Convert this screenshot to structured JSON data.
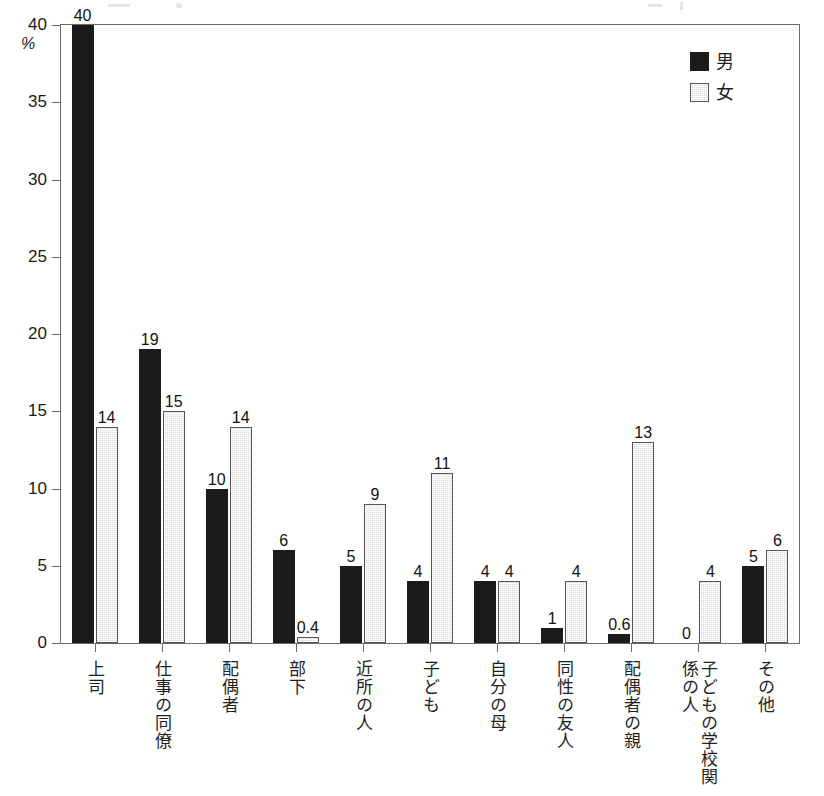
{
  "chart_data": {
    "type": "bar",
    "title": "",
    "xlabel": "",
    "ylabel": "%",
    "ylim": [
      0,
      40
    ],
    "yticks": [
      0,
      5,
      10,
      15,
      20,
      25,
      30,
      35,
      40
    ],
    "ytick_labels": [
      "0",
      "5",
      "10",
      "15",
      "20",
      "25",
      "30",
      "35",
      "40"
    ],
    "grid": false,
    "legend_position": "top-right",
    "categories": [
      "上司",
      "仕事の同僚",
      "配偶者",
      "部下",
      "近所の人",
      "子ども",
      "自分の母",
      "同性の友人",
      "配偶者の親",
      "子どもの学校関係の人",
      "その他"
    ],
    "series": [
      {
        "name": "男",
        "color": "#1b1b1b",
        "values": [
          40,
          19,
          10,
          6,
          5,
          4,
          4,
          1,
          0.6,
          0,
          5
        ],
        "value_labels": [
          "40",
          "19",
          "10",
          "6",
          "5",
          "4",
          "4",
          "1",
          "0.6",
          "0",
          "5"
        ]
      },
      {
        "name": "女",
        "color": "#dcdcdc",
        "values": [
          14,
          15,
          14,
          0.4,
          9,
          11,
          4,
          4,
          13,
          4,
          6
        ],
        "value_labels": [
          "14",
          "15",
          "14",
          "0.4",
          "9",
          "11",
          "4",
          "4",
          "13",
          "4",
          "6"
        ]
      }
    ]
  },
  "axis": {
    "unit_label": "%"
  },
  "legend": {
    "items": [
      {
        "label": "男",
        "swatch": "black-square-swatch"
      },
      {
        "label": "女",
        "swatch": "gray-square-swatch"
      }
    ]
  }
}
